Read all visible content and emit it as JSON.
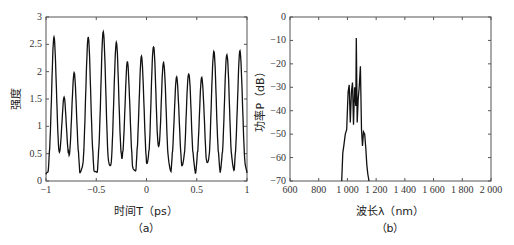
{
  "chart_data": [
    {
      "type": "line",
      "panel": "(a)",
      "xlabel": "时间T（ps）",
      "ylabel": "强度",
      "xlim": [
        -1,
        1
      ],
      "ylim": [
        0,
        3
      ],
      "xticks": [
        "-1",
        "-0.5",
        "0",
        "0.5",
        "1"
      ],
      "yticks": [
        "0",
        "0.5",
        "1",
        "1.5",
        "2",
        "2.5",
        "3"
      ],
      "peaks": {
        "x": [
          -0.92,
          -0.82,
          -0.72,
          -0.58,
          -0.43,
          -0.3,
          -0.19,
          -0.05,
          0.07,
          0.17,
          0.3,
          0.42,
          0.55,
          0.67,
          0.8,
          0.93
        ],
        "y": [
          2.6,
          1.5,
          1.95,
          2.6,
          2.7,
          2.5,
          2.15,
          2.25,
          2.45,
          2.15,
          1.87,
          1.95,
          1.87,
          2.35,
          2.3,
          2.35
        ]
      },
      "grid": false
    },
    {
      "type": "line",
      "panel": "(b)",
      "xlabel": "波长λ（nm）",
      "ylabel": "功率P（dB）",
      "xlim": [
        600,
        2000
      ],
      "ylim": [
        -70,
        0
      ],
      "xticks": [
        "600",
        "800",
        "1 000",
        "1 200",
        "1 400",
        "1 600",
        "1 800",
        "2 000"
      ],
      "yticks": [
        "0",
        "-10",
        "-20",
        "-30",
        "-40",
        "-50",
        "-60",
        "-70"
      ],
      "x": [
        960,
        968,
        975,
        985,
        995,
        1005,
        1012,
        1020,
        1028,
        1035,
        1042,
        1050,
        1058,
        1062,
        1068,
        1075,
        1082,
        1090,
        1098,
        1105,
        1112,
        1120,
        1128,
        1135,
        1142,
        1150
      ],
      "y": [
        -70,
        -58,
        -55,
        -50,
        -48,
        -32,
        -29,
        -45,
        -32,
        -28,
        -46,
        -30,
        -38,
        -9,
        -45,
        -35,
        -30,
        -21,
        -48,
        -55,
        -49,
        -50,
        -56,
        -63,
        -67,
        -70
      ],
      "grid": false
    }
  ],
  "labels": {
    "a_caption": "（a）",
    "b_caption": "（b）",
    "a_xlabel": "时间T（ps）",
    "a_ylabel": "强度",
    "b_xlabel": "波长λ（nm）",
    "b_ylabel": "功率P（dB）"
  }
}
